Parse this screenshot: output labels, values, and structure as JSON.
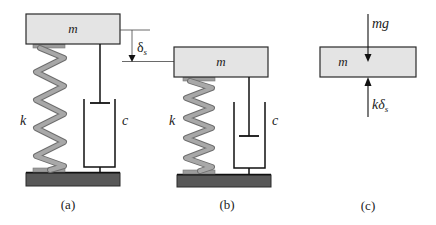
{
  "colors": {
    "mass_fill": "#e4e4e4",
    "outline": "#2a2a2a",
    "spring": "#9c9c9c",
    "ground": "#585858"
  },
  "panels": [
    {
      "id": "a",
      "caption": "(a)",
      "mass_label": "m",
      "spring_label": "k",
      "damper_label": "c",
      "description": "Undeformed spring-mass-damper system"
    },
    {
      "id": "b",
      "caption": "(b)",
      "mass_label": "m",
      "spring_label": "k",
      "damper_label": "c",
      "description": "Static equilibrium position, spring compressed"
    },
    {
      "id": "c",
      "caption": "(c)",
      "mass_label": "m",
      "force_top_label": "mg",
      "force_bottom_label_main": "kδ",
      "force_bottom_label_sub": "s",
      "description": "Free-body diagram of mass"
    }
  ],
  "deflection": {
    "symbol": "δ",
    "subscript": "s"
  }
}
